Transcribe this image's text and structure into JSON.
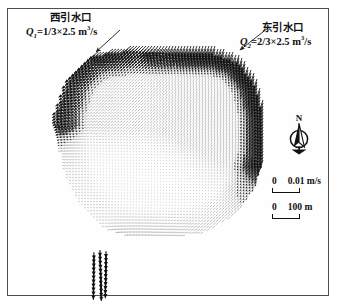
{
  "figure": {
    "type": "vector-field-map",
    "background_color": "#ffffff",
    "frame_color": "#4e4e4e",
    "vector_color": "#111111"
  },
  "annotations": {
    "west_inlet": {
      "title": "西引水口",
      "equation_prefix": "Q",
      "equation_subscript": "1",
      "equation_body": "=1/3×2.5 m",
      "equation_superscript": "3",
      "equation_suffix": "/s",
      "equation_plain": "Q1=1/3×2.5 m3/s",
      "leader_from": [
        120,
        30
      ],
      "leader_to": [
        96,
        52
      ]
    },
    "east_inlet": {
      "title": "东引水口",
      "equation_prefix": "Q",
      "equation_subscript": "2",
      "equation_body": "=2/3×2.5 m",
      "equation_superscript": "3",
      "equation_suffix": "/s",
      "equation_plain": "Q2=2/3×2.5 m3/s",
      "leader_from": [
        268,
        28
      ],
      "leader_to": [
        240,
        50
      ]
    }
  },
  "north_arrow": {
    "label": "N",
    "icon": "north-arrow-icon"
  },
  "scales": [
    {
      "id": "velocity",
      "zero_label": "0",
      "value_label": "0.01 m/s",
      "bar_length_px": 28
    },
    {
      "id": "distance",
      "zero_label": "0",
      "value_label": "100 m",
      "bar_length_px": 28
    }
  ],
  "chart_data": {
    "type": "scatter",
    "title": "",
    "xlabel": "",
    "ylabel": "",
    "legend_position": "right",
    "grid": false,
    "velocity_scale": {
      "bar_px": 28,
      "value": 0.01,
      "unit": "m/s"
    },
    "distance_scale": {
      "bar_px": 28,
      "value": 100,
      "unit": "m"
    },
    "sources": [
      {
        "name": "西引水口",
        "x": 96,
        "y": 52,
        "discharge_m3s": 0.8333,
        "discharge_expr": "1/3×2.5",
        "jet_direction_deg": 215
      },
      {
        "name": "东引水口",
        "x": 238,
        "y": 54,
        "discharge_m3s": 1.6667,
        "discharge_expr": "2/3×2.5",
        "jet_direction_deg": 250
      }
    ],
    "sinks": [
      {
        "name": "outlet",
        "x": 104,
        "y": 250,
        "direction_deg": 270
      }
    ],
    "domain_outline": [
      [
        96,
        52
      ],
      [
        130,
        46
      ],
      [
        176,
        44
      ],
      [
        216,
        46
      ],
      [
        240,
        54
      ],
      [
        258,
        78
      ],
      [
        266,
        110
      ],
      [
        266,
        150
      ],
      [
        256,
        186
      ],
      [
        236,
        214
      ],
      [
        206,
        232
      ],
      [
        168,
        238
      ],
      [
        130,
        236
      ],
      [
        104,
        228
      ],
      [
        82,
        206
      ],
      [
        66,
        176
      ],
      [
        60,
        142
      ],
      [
        62,
        108
      ],
      [
        72,
        76
      ]
    ]
  }
}
